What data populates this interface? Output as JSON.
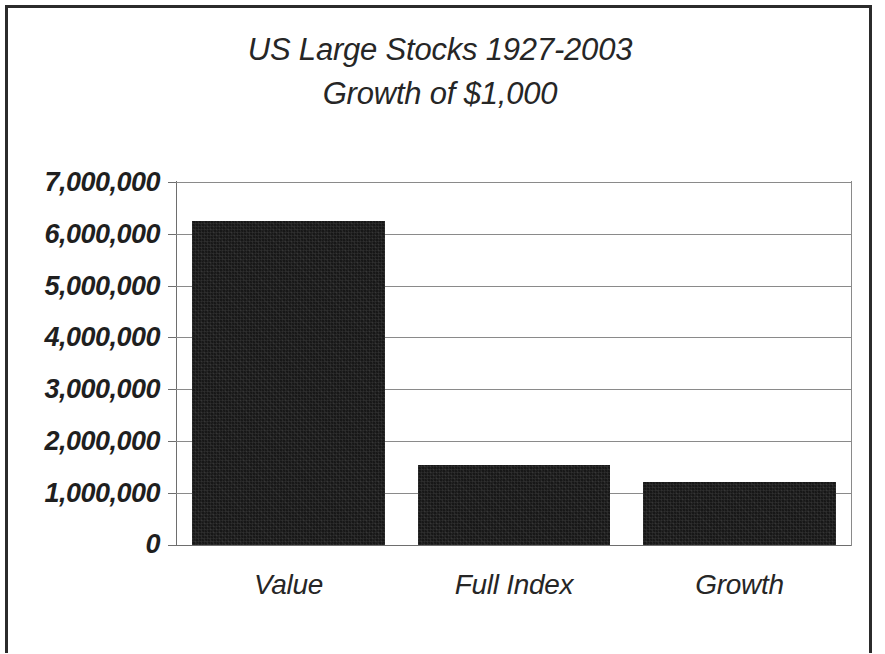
{
  "chart_data": {
    "type": "bar",
    "title": "US Large Stocks 1927-2003 Growth of $1,000",
    "title_line1": "US Large Stocks 1927-2003",
    "title_line2": "Growth of $1,000",
    "xlabel": "",
    "ylabel": "",
    "categories": [
      "Value",
      "Full Index",
      "Growth"
    ],
    "values": [
      6250000,
      1550000,
      1220000
    ],
    "ylim": [
      0,
      7000000
    ],
    "ytick_values": [
      0,
      1000000,
      2000000,
      3000000,
      4000000,
      5000000,
      6000000,
      7000000
    ],
    "ytick_labels": [
      "0",
      "1,000,000",
      "2,000,000",
      "3,000,000",
      "4,000,000",
      "5,000,000",
      "6,000,000",
      "7,000,000"
    ],
    "grid": true,
    "legend": false,
    "legend_position": "none",
    "bar_color": "#171717",
    "gridline_color": "#8a8a8a",
    "background_color": "#ffffff",
    "border_color": "#2b2b2b",
    "text_color": "#262626"
  }
}
